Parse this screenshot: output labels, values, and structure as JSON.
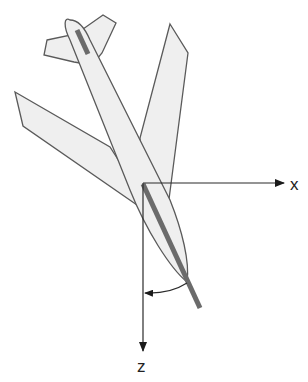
{
  "diagram": {
    "axes": [
      {
        "name": "x",
        "label": "x",
        "direction": "right"
      },
      {
        "name": "z",
        "label": "z",
        "direction": "down"
      }
    ],
    "angle_indicator": {
      "from": "aircraft longitudinal axis",
      "to": "z axis",
      "arrow": "curved"
    },
    "colors": {
      "body_fill": "#efefef",
      "outline": "#5a5a5a",
      "rod": "#6b6b6b",
      "axis": "#2a2a2a"
    }
  }
}
